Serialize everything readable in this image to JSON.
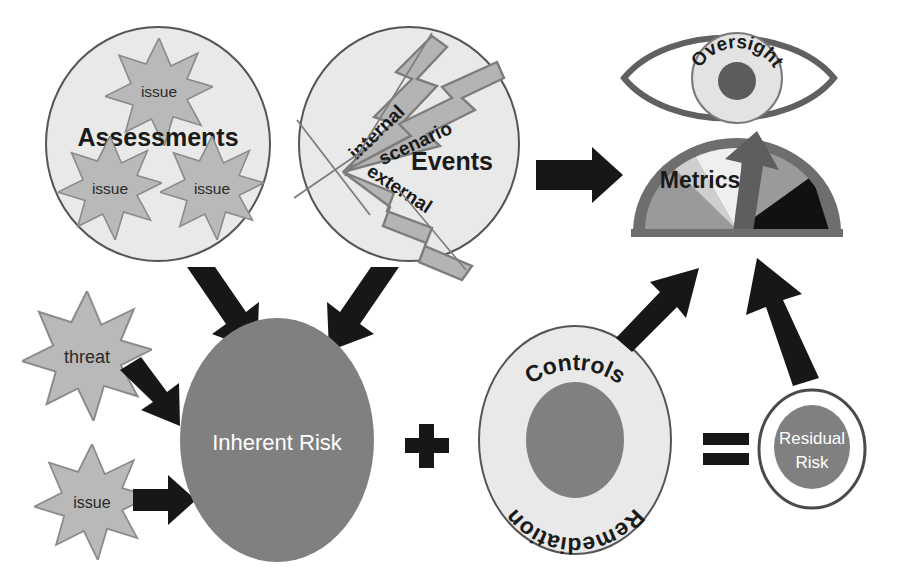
{
  "diagram": {
    "type": "flow-diagram",
    "background_color": "#ffffff"
  },
  "palette": {
    "circle_fill_light": "#e9e9e9",
    "circle_stroke": "#555555",
    "star_fill": "#b9b9b9",
    "star_stroke": "#8a8a8a",
    "bolt_fill": "#b4b4b4",
    "bolt_stroke": "#7d7d7d",
    "risk_gray": "#808080",
    "arrow_black": "#171717",
    "gauge_rim": "#6e6e6e",
    "gauge_seg_mid": "#9a9a9a",
    "gauge_seg_light": "#d0d0d0",
    "gauge_seg_lightest": "#ededed",
    "gauge_seg_dark": "#111111",
    "needle": "#5e5e5e",
    "eye_stroke": "#606060",
    "pupil": "#5c5c5c",
    "text_dark": "#1a1a1a",
    "text_light": "#ffffff"
  },
  "nodes": {
    "assessments": {
      "label": "Assessments",
      "issues": [
        {
          "label": "issue"
        },
        {
          "label": "issue"
        },
        {
          "label": "issue"
        }
      ]
    },
    "events": {
      "label": "Events",
      "bolts": [
        {
          "label": "internal"
        },
        {
          "label": "scenario"
        },
        {
          "label": "external"
        }
      ]
    },
    "oversight": {
      "label": "Oversight"
    },
    "metrics": {
      "label": "Metrics"
    },
    "threat_star": {
      "label": "threat"
    },
    "issue_star": {
      "label": "issue"
    },
    "inherent_risk": {
      "label": "Inherent Risk"
    },
    "controls": {
      "label_top": "Controls",
      "label_bottom": "Remediation"
    },
    "residual_risk": {
      "label_line1": "Residual",
      "label_line2": "Risk"
    }
  },
  "operators": {
    "plus": {
      "symbol": "+",
      "name": "plus-operator"
    },
    "equals": {
      "symbol": "=",
      "name": "equals-operator"
    }
  },
  "connectors": [
    {
      "name": "assessments-to-inherent-risk",
      "direction": "down-right"
    },
    {
      "name": "events-to-inherent-risk",
      "direction": "down-left"
    },
    {
      "name": "events-to-metrics",
      "direction": "right"
    },
    {
      "name": "threat-to-inherent-risk",
      "direction": "down-right"
    },
    {
      "name": "issue-to-inherent-risk",
      "direction": "right"
    },
    {
      "name": "controls-to-metrics",
      "direction": "up-right"
    },
    {
      "name": "residual-risk-to-metrics",
      "direction": "up"
    }
  ]
}
